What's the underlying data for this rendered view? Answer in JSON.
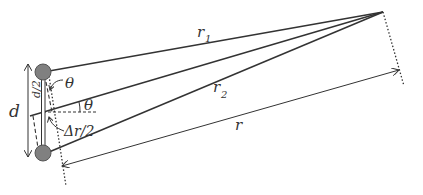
{
  "diagram": {
    "type": "two-source path difference geometry",
    "colors": {
      "line": "#333333",
      "source_fill": "#808080",
      "source_stroke": "#555555",
      "background": "#ffffff"
    },
    "labels": {
      "r1": "r",
      "r1_sub": "1",
      "r2": "r",
      "r2_sub": "2",
      "r": "r",
      "d": "d",
      "half_d": "d/2",
      "theta_top": "θ",
      "theta_mid": "θ",
      "delta_r_half": "Δr/2"
    },
    "elements": {
      "sources": [
        "top-source",
        "bottom-source"
      ],
      "rays": [
        "r1 from top source to far point",
        "central ray from midpoint to far point",
        "r2 from bottom source to far point"
      ],
      "arrows": [
        "d vertical double arrow",
        "r distance arrow"
      ],
      "guides": [
        "dashed perpendicular through sources",
        "dotted perpendicular at far point",
        "dashed horizontal reference at midpoint"
      ]
    }
  }
}
